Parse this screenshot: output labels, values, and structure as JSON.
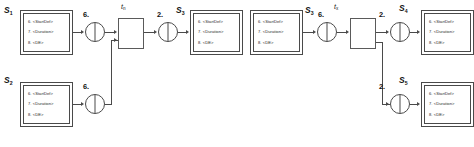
{
  "diagram": {
    "state_box_lines": [
      "6. <StartDef>",
      "7. <Duration>",
      "8. <DE>"
    ],
    "states": [
      {
        "id": "s1",
        "label": "S",
        "subscript": "1"
      },
      {
        "id": "s2",
        "label": "S",
        "subscript": "2"
      },
      {
        "id": "s3a",
        "label": "S",
        "subscript": "3"
      },
      {
        "id": "s3b",
        "label": "S",
        "subscript": "3"
      },
      {
        "id": "s4",
        "label": "S",
        "subscript": "4"
      },
      {
        "id": "s5",
        "label": "S",
        "subscript": "5"
      }
    ],
    "connectors": [
      {
        "id": "c1",
        "label": "6."
      },
      {
        "id": "c2",
        "label": "6."
      },
      {
        "id": "c3",
        "label": "2."
      },
      {
        "id": "c4",
        "label": "6."
      },
      {
        "id": "c5",
        "label": "2."
      },
      {
        "id": "c6",
        "label": "2."
      }
    ],
    "transitions": [
      {
        "id": "tn",
        "label": "t",
        "subscript": "n"
      },
      {
        "id": "tx",
        "label": "t",
        "subscript": "x"
      }
    ],
    "colors": {
      "line": "#4a4a4a",
      "text": "#1a1a1a",
      "background": "#ffffff"
    }
  }
}
